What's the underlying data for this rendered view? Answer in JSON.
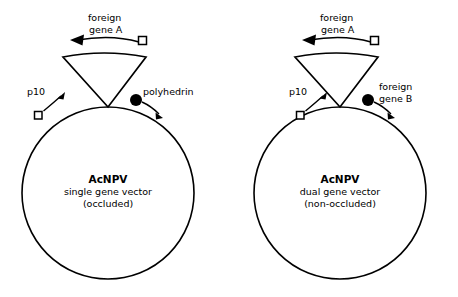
{
  "figure": {
    "title": "",
    "background_color": "#ffffff",
    "line_color": "#000000",
    "panels": [
      {
        "id": "left",
        "genome_label_title": "AcNPV",
        "genome_label_line2": "single gene vector",
        "genome_label_line3": "(occluded)",
        "top_gene_label_line1": "foreign",
        "top_gene_label_line2": "gene A",
        "left_promoter_label": "p10",
        "right_element_label_line1": "polyhedrin",
        "right_element_label_line2": "",
        "left_promoter_marker": "open-square",
        "right_element_marker": "filled-circle",
        "top_gene_marker": "open-square",
        "wedge_present": true
      },
      {
        "id": "right",
        "genome_label_title": "AcNPV",
        "genome_label_line2": "dual gene vector",
        "genome_label_line3": "(non-occluded)",
        "top_gene_label_line1": "foreign",
        "top_gene_label_line2": "gene A",
        "left_promoter_label": "p10",
        "right_element_label_line1": "foreign",
        "right_element_label_line2": "gene B",
        "left_promoter_marker": "open-square",
        "right_element_marker": "filled-circle",
        "top_gene_marker": "open-square",
        "wedge_present": true
      }
    ],
    "legend_notes": {
      "open_square_meaning": "promoter marker",
      "filled_circle_meaning": "gene locus marker",
      "arrow_meaning": "transcription direction"
    }
  }
}
